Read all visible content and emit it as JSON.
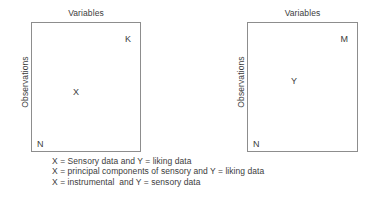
{
  "diagram": {
    "type": "two-matrix-schematic",
    "background_color": "#ffffff",
    "border_color": "#8d8d8d",
    "text_color": "#3c3c3c",
    "matrices": [
      {
        "id": "x",
        "column_label": "Variables",
        "row_label": "Observations",
        "center_letter": "X",
        "columns_letter": "K",
        "rows_letter": "N"
      },
      {
        "id": "y",
        "column_label": "Variables",
        "row_label": "Observations",
        "center_letter": "Y",
        "columns_letter": "M",
        "rows_letter": "N"
      }
    ],
    "caption": {
      "lines": [
        "X = Sensory data and Y = liking data",
        "X = principal components of sensory and Y = liking data",
        "X = instrumental  and Y = sensory data"
      ]
    }
  }
}
